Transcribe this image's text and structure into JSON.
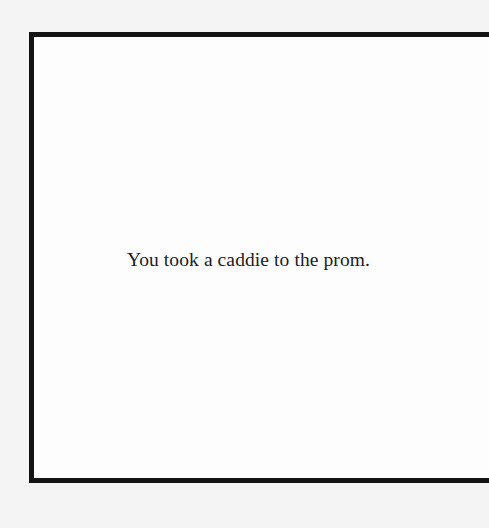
{
  "card": {
    "text": "You took a caddie to the prom."
  },
  "colors": {
    "border": "#141414",
    "background": "#f4f4f4",
    "card_background": "#fdfdfd",
    "text": "#1c1c1c"
  }
}
